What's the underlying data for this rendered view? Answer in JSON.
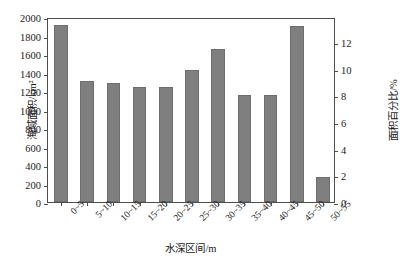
{
  "chart_data": {
    "type": "bar",
    "title": "",
    "categories": [
      "0~5",
      "5~10",
      "10~15",
      "15~20",
      "20~25",
      "25~30",
      "30~35",
      "35~40",
      "40~45",
      "45~50",
      "50~55"
    ],
    "values": [
      1915,
      1310,
      1290,
      1245,
      1240,
      1430,
      1650,
      1155,
      1155,
      1900,
      270
    ],
    "series": [
      {
        "name": "海域面积",
        "values": [
          1915,
          1310,
          1290,
          1245,
          1240,
          1430,
          1650,
          1155,
          1155,
          1900,
          270
        ]
      }
    ],
    "secondary_values_percent": [
      13.3,
      9.1,
      8.9,
      8.6,
      8.6,
      9.9,
      11.4,
      8.0,
      8.0,
      13.2,
      1.9
    ],
    "xlabel": "水深区间/m",
    "ylabel": "海域面积/km²",
    "ylabel_right": "面积百分比/%",
    "ylim": [
      0,
      2000
    ],
    "ylim_right": [
      0,
      13.86
    ],
    "yticks": [
      0,
      200,
      400,
      600,
      800,
      1000,
      1200,
      1400,
      1600,
      1800,
      2000
    ],
    "yticks_right": [
      0,
      2,
      4,
      6,
      8,
      10,
      12
    ],
    "grid": false,
    "legend": "none",
    "bar_color": "#7f7f7f",
    "axis_color": "#4d4d4d",
    "background": "#ffffff"
  }
}
